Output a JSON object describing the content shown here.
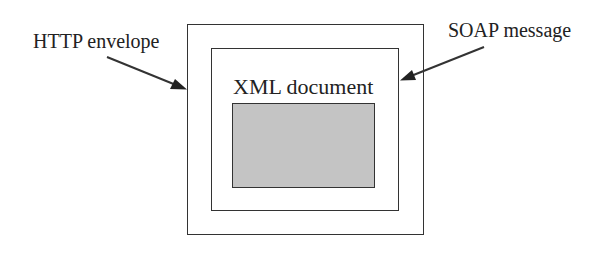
{
  "diagram": {
    "type": "nested-containers",
    "layers": [
      {
        "id": "http",
        "label": "HTTP envelope",
        "role": "outermost container"
      },
      {
        "id": "soap",
        "label": "SOAP message",
        "role": "middle container"
      },
      {
        "id": "xml",
        "label": "XML document",
        "role": "inner container",
        "content_fill": "#c4c4c4"
      }
    ],
    "arrows": [
      {
        "from": "HTTP envelope",
        "to": "outer box left edge"
      },
      {
        "from": "SOAP message",
        "to": "middle box right edge"
      }
    ]
  },
  "labels": {
    "http": "HTTP envelope",
    "soap": "SOAP message",
    "xml": "XML document"
  },
  "colors": {
    "stroke": "#333333",
    "fill_inner": "#c4c4c4",
    "background": "#ffffff",
    "text": "#222222"
  }
}
